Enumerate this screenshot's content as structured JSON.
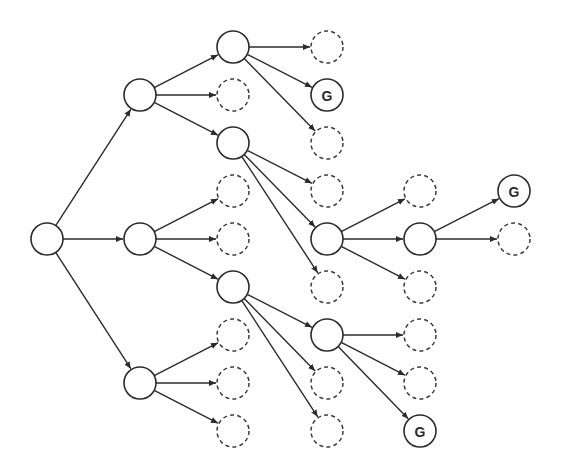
{
  "diagram": {
    "type": "search-tree",
    "node_radius": 16,
    "colors": {
      "stroke": "#2b2b2b",
      "background": "#ffffff"
    },
    "nodes": [
      {
        "id": "root",
        "x": 47,
        "y": 239,
        "style": "solid",
        "label": ""
      },
      {
        "id": "a",
        "x": 140,
        "y": 95,
        "style": "solid",
        "label": ""
      },
      {
        "id": "b",
        "x": 140,
        "y": 239,
        "style": "solid",
        "label": ""
      },
      {
        "id": "c",
        "x": 140,
        "y": 383,
        "style": "solid",
        "label": ""
      },
      {
        "id": "a1",
        "x": 233,
        "y": 47,
        "style": "solid",
        "label": ""
      },
      {
        "id": "a_d1",
        "x": 233,
        "y": 95,
        "style": "dashed",
        "label": ""
      },
      {
        "id": "a2",
        "x": 233,
        "y": 143,
        "style": "solid",
        "label": ""
      },
      {
        "id": "b_d1",
        "x": 233,
        "y": 191,
        "style": "dashed",
        "label": ""
      },
      {
        "id": "b_d2",
        "x": 233,
        "y": 239,
        "style": "dashed",
        "label": ""
      },
      {
        "id": "b1",
        "x": 233,
        "y": 287,
        "style": "solid",
        "label": ""
      },
      {
        "id": "c_d1",
        "x": 233,
        "y": 335,
        "style": "dashed",
        "label": ""
      },
      {
        "id": "c_d2",
        "x": 233,
        "y": 383,
        "style": "dashed",
        "label": ""
      },
      {
        "id": "c_d3",
        "x": 233,
        "y": 431,
        "style": "dashed",
        "label": ""
      },
      {
        "id": "a1_d1",
        "x": 327,
        "y": 47,
        "style": "dashed",
        "label": ""
      },
      {
        "id": "g1",
        "x": 327,
        "y": 95,
        "style": "solid",
        "label": "G"
      },
      {
        "id": "a1_d2",
        "x": 327,
        "y": 143,
        "style": "dashed",
        "label": ""
      },
      {
        "id": "a2_d1",
        "x": 327,
        "y": 191,
        "style": "dashed",
        "label": ""
      },
      {
        "id": "d",
        "x": 327,
        "y": 239,
        "style": "solid",
        "label": ""
      },
      {
        "id": "a2_d2",
        "x": 327,
        "y": 287,
        "style": "dashed",
        "label": ""
      },
      {
        "id": "e",
        "x": 327,
        "y": 335,
        "style": "solid",
        "label": ""
      },
      {
        "id": "b1_d1",
        "x": 327,
        "y": 383,
        "style": "dashed",
        "label": ""
      },
      {
        "id": "b1_d2",
        "x": 327,
        "y": 431,
        "style": "dashed",
        "label": ""
      },
      {
        "id": "d_d1",
        "x": 420,
        "y": 191,
        "style": "dashed",
        "label": ""
      },
      {
        "id": "f",
        "x": 420,
        "y": 239,
        "style": "solid",
        "label": ""
      },
      {
        "id": "d_d2",
        "x": 420,
        "y": 287,
        "style": "dashed",
        "label": ""
      },
      {
        "id": "e_d1",
        "x": 420,
        "y": 335,
        "style": "dashed",
        "label": ""
      },
      {
        "id": "e_d2",
        "x": 420,
        "y": 383,
        "style": "dashed",
        "label": ""
      },
      {
        "id": "g3",
        "x": 420,
        "y": 431,
        "style": "solid",
        "label": "G"
      },
      {
        "id": "g2",
        "x": 514,
        "y": 191,
        "style": "solid",
        "label": "G"
      },
      {
        "id": "f_d1",
        "x": 514,
        "y": 239,
        "style": "dashed",
        "label": ""
      }
    ],
    "edges": [
      [
        "root",
        "a"
      ],
      [
        "root",
        "b"
      ],
      [
        "root",
        "c"
      ],
      [
        "a",
        "a1"
      ],
      [
        "a",
        "a_d1"
      ],
      [
        "a",
        "a2"
      ],
      [
        "b",
        "b_d1"
      ],
      [
        "b",
        "b_d2"
      ],
      [
        "b",
        "b1"
      ],
      [
        "c",
        "c_d1"
      ],
      [
        "c",
        "c_d2"
      ],
      [
        "c",
        "c_d3"
      ],
      [
        "a1",
        "a1_d1"
      ],
      [
        "a1",
        "g1"
      ],
      [
        "a1",
        "a1_d2"
      ],
      [
        "a2",
        "a2_d1"
      ],
      [
        "a2",
        "d"
      ],
      [
        "a2",
        "a2_d2"
      ],
      [
        "b1",
        "e"
      ],
      [
        "b1",
        "b1_d1"
      ],
      [
        "b1",
        "b1_d2"
      ],
      [
        "d",
        "d_d1"
      ],
      [
        "d",
        "f"
      ],
      [
        "d",
        "d_d2"
      ],
      [
        "e",
        "e_d1"
      ],
      [
        "e",
        "e_d2"
      ],
      [
        "e",
        "g3"
      ],
      [
        "f",
        "g2"
      ],
      [
        "f",
        "f_d1"
      ]
    ]
  }
}
